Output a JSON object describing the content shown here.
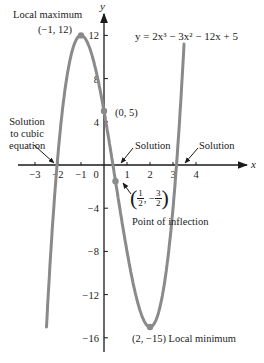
{
  "chart_data": {
    "type": "line",
    "title": "y = 2x³ − 3x² − 12x + 5",
    "equation": "y = 2x³ − 3x² − 12x + 5",
    "xlabel": "x",
    "ylabel": "y",
    "xlim": [
      -3.5,
      6.2
    ],
    "ylim": [
      -17.5,
      14.3
    ],
    "x_ticks": [
      -3,
      -2,
      -1,
      0,
      1,
      2,
      3,
      4
    ],
    "x_tick_labels": [
      "−3",
      "−2",
      "−1",
      "0",
      "1",
      "2",
      "3",
      "4"
    ],
    "y_ticks": [
      12,
      8,
      4,
      -4,
      -8,
      -12,
      -16
    ],
    "y_tick_labels": [
      "12",
      "8",
      "4",
      "−4",
      "−8",
      "−12",
      "−16"
    ],
    "grid": false,
    "series": [
      {
        "name": "y = 2x³ − 3x² − 12x + 5",
        "color": "#8a8a8a",
        "x_range": [
          -2.5,
          3.48
        ],
        "sample_points": [
          {
            "x": -2.5,
            "y": -15
          },
          {
            "x": -2,
            "y": 1
          },
          {
            "x": -1,
            "y": 12
          },
          {
            "x": 0,
            "y": 5
          },
          {
            "x": 0.5,
            "y": -1.5
          },
          {
            "x": 1,
            "y": -8
          },
          {
            "x": 2,
            "y": -15
          },
          {
            "x": 3,
            "y": -4
          },
          {
            "x": 3.48,
            "y": 11
          }
        ]
      }
    ],
    "marked_points": [
      {
        "x": -1,
        "y": 12,
        "label": "(−1, 12)",
        "note": "Local maximum"
      },
      {
        "x": 0,
        "y": 5,
        "label": "(0, 5)",
        "note": "y-intercept"
      },
      {
        "x": 0.5,
        "y": -1.5,
        "label": "(1/2, −3/2)",
        "note": "Point of inflection"
      },
      {
        "x": 2,
        "y": -15,
        "label": "(2, −15)",
        "note": "Local minimum"
      }
    ],
    "annotations": [
      {
        "text": "Local maximum",
        "target": [
          -1,
          12
        ]
      },
      {
        "text": "Solution to cubic equation",
        "target": [
          -2.1,
          0
        ]
      },
      {
        "text": "Solution",
        "target": [
          0.4,
          0
        ]
      },
      {
        "text": "Solution",
        "target": [
          3.3,
          0
        ]
      },
      {
        "text": "Point of inflection",
        "target": [
          0.5,
          -1.5
        ]
      },
      {
        "text": "Local minimum",
        "target": [
          2,
          -15
        ]
      }
    ]
  },
  "labels": {
    "equation": "y = 2x³ − 3x² − 12x + 5",
    "y_axis": "y",
    "x_axis": "x",
    "local_max_title": "Local maximum",
    "local_max_coords": "(−1, 12)",
    "intercept_coords": "(0, 5)",
    "solution_left_line1": "Solution",
    "solution_left_line2": "to cubic",
    "solution_left_line3": "equation",
    "solution_mid": "Solution",
    "solution_right": "Solution",
    "inflection_num1": "1",
    "inflection_den1": "2",
    "inflection_sep": ", −",
    "inflection_num2": "3",
    "inflection_den2": "2",
    "inflection_title": "Point of inflection",
    "local_min": "(2, −15) Local minimum"
  },
  "style": {
    "curve_color": "#8a8a8a",
    "point_color": "#8a8a8a",
    "axis_color": "#1a1a1a"
  }
}
